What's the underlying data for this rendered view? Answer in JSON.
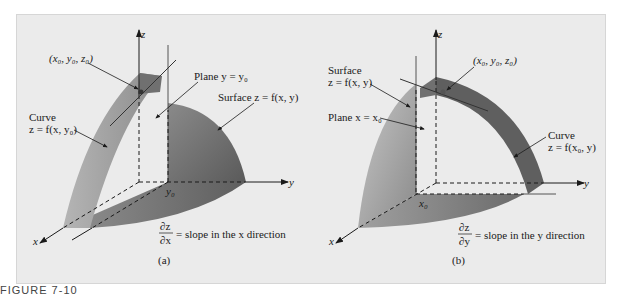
{
  "figure": {
    "caption_label": "FIGURE 7-10",
    "panel_a": {
      "sublabel": "(a)",
      "axes": {
        "x": "x",
        "y": "y",
        "z": "z"
      },
      "tick_y0": "y₀",
      "point_label": "(x₀, y₀, z₀)",
      "plane_label": "Plane y = y₀",
      "surface_label": "Surface z = f(x, y)",
      "curve_label_line1": "Curve",
      "curve_label_line2": "z = f(x, y₀)",
      "derivative_num": "∂z",
      "derivative_den": "∂x",
      "derivative_text": "= slope in the x direction"
    },
    "panel_b": {
      "sublabel": "(b)",
      "axes": {
        "x": "x",
        "y": "y",
        "z": "z"
      },
      "tick_x0": "x₀",
      "point_label": "(x₀, y₀, z₀)",
      "plane_label": "Plane x = x₀",
      "surface_label_line1": "Surface",
      "surface_label_line2": "z = f(x, y)",
      "curve_label_line1": "Curve",
      "curve_label_line2": "z = f(x₀, y)",
      "derivative_num": "∂z",
      "derivative_den": "∂y",
      "derivative_text": "= slope in the y direction"
    },
    "colors": {
      "background": "#ebebeb",
      "surface_dark": "#6e6e6e",
      "surface_light": "#bdbdbd",
      "band_dark": "#5e5e5e",
      "axis": "#1a1a1a"
    }
  }
}
